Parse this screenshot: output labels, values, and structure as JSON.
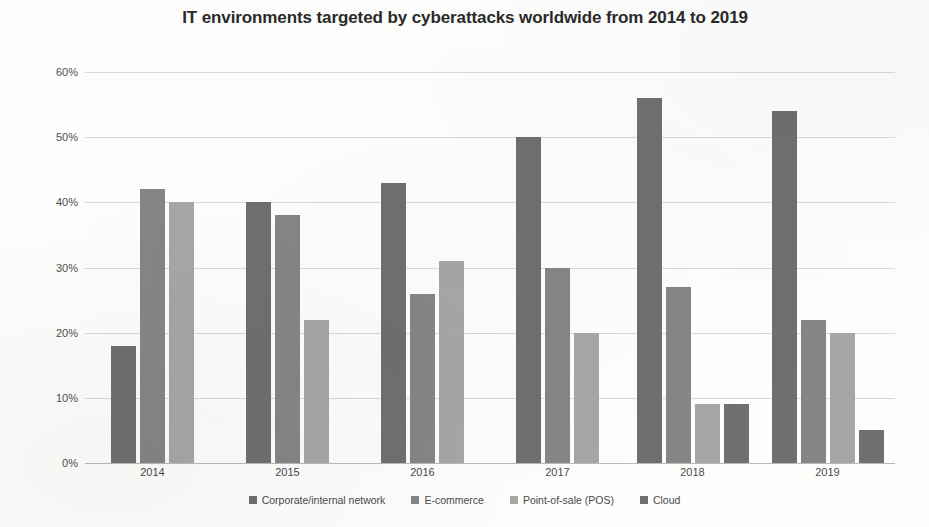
{
  "chart_data": {
    "type": "bar",
    "title": "IT environments targeted by cyberattacks worldwide from 2014 to 2019",
    "xlabel": "",
    "ylabel": "",
    "ylim": [
      0,
      60
    ],
    "ytick_labels": [
      "0%",
      "10%",
      "20%",
      "30%",
      "40%",
      "50%",
      "60%"
    ],
    "ytick_values": [
      0,
      10,
      20,
      30,
      40,
      50,
      60
    ],
    "grid": true,
    "legend_position": "bottom",
    "value_suffix": "%",
    "categories": [
      "2014",
      "2015",
      "2016",
      "2017",
      "2018",
      "2019"
    ],
    "series": [
      {
        "name": "Corporate/internal network",
        "color": "#6f6f6f",
        "values": [
          18,
          40,
          43,
          50,
          56,
          54
        ]
      },
      {
        "name": "E-commerce",
        "color": "#858585",
        "values": [
          42,
          38,
          26,
          30,
          27,
          22
        ]
      },
      {
        "name": "Point-of-sale (POS)",
        "color": "#a6a6a6",
        "values": [
          40,
          22,
          31,
          20,
          9,
          20
        ]
      },
      {
        "name": "Cloud",
        "color": "#6f6f6f",
        "values": [
          null,
          null,
          null,
          null,
          9,
          5
        ]
      }
    ]
  }
}
